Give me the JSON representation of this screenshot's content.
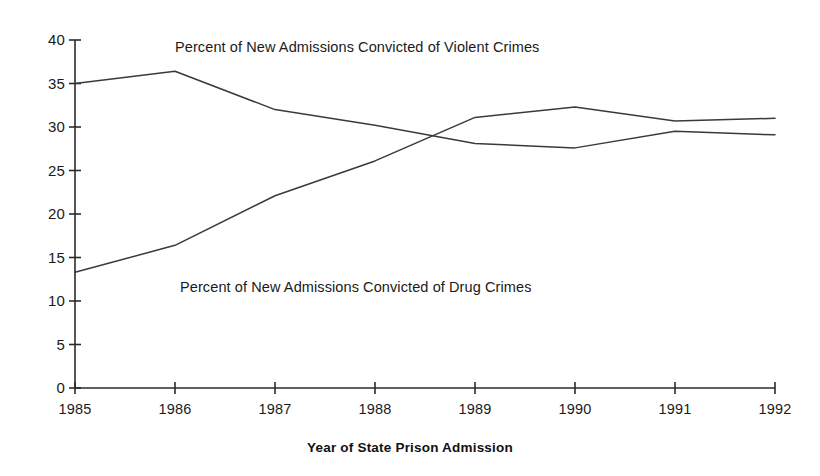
{
  "chart_data": {
    "type": "line",
    "title": "",
    "subtitle": "",
    "xlabel": "Year of State Prison Admission",
    "ylabel": "",
    "x": [
      1985,
      1986,
      1987,
      1988,
      1989,
      1990,
      1991,
      1992
    ],
    "categories": [
      "1985",
      "1986",
      "1987",
      "1988",
      "1989",
      "1990",
      "1991",
      "1992"
    ],
    "xlim": [
      1985,
      1992
    ],
    "ylim": [
      0,
      40
    ],
    "yticks": [
      0,
      5,
      10,
      15,
      20,
      25,
      30,
      35,
      40
    ],
    "ytick_labels": [
      "0",
      "5",
      "10",
      "15",
      "20",
      "25",
      "30",
      "35",
      "40"
    ],
    "grid": false,
    "legend": "inline-annotations",
    "series": [
      {
        "name": "Percent of New Admissions Convicted of Violent Crimes",
        "values": [
          35.0,
          36.4,
          32.0,
          30.2,
          28.1,
          27.6,
          29.5,
          29.1
        ],
        "color": "#3a3a3a"
      },
      {
        "name": "Percent of New Admissions Convicted of Drug Crimes",
        "values": [
          13.3,
          16.4,
          22.1,
          26.1,
          31.1,
          32.3,
          30.7,
          31.0
        ],
        "color": "#3a3a3a"
      }
    ],
    "annotations": [
      {
        "text": "Percent of New Admissions Convicted of Violent Crimes",
        "x": 1986.0,
        "y": 39.2
      },
      {
        "text": "Percent of New Admissions Convicted of Drug Crimes",
        "x": 1986.05,
        "y": 11.6
      }
    ]
  },
  "axis": {
    "x_title": "Year of State Prison Admission"
  }
}
